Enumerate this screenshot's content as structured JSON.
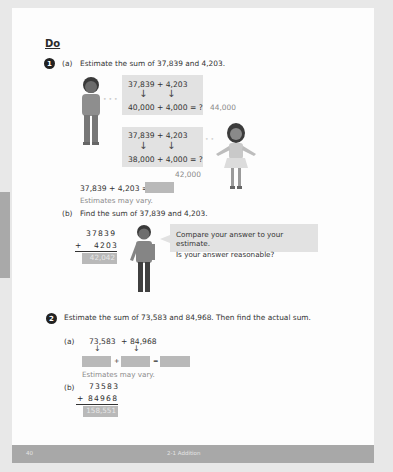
{
  "section": {
    "heading": "Do"
  },
  "problem1": {
    "number": "1",
    "part_a": {
      "label": "(a)",
      "prompt": "Estimate the sum of 37,839 and 4,203.",
      "boy_box": {
        "top": "37,839 + 4,203",
        "bottom": "40,000 + 4,000 = ?",
        "answer": "44,000"
      },
      "girl_box": {
        "top": "37,839 + 4,203",
        "bottom": "38,000 + 4,000 = ?",
        "answer": "42,000"
      },
      "equation": "37,839 + 4,203 =",
      "note": "Estimates may vary."
    },
    "part_b": {
      "label": "(b)",
      "prompt": "Find the sum of 37,839 and 4,203.",
      "addend1": "37839",
      "operator": "+",
      "addend2": "4203",
      "answer": "42,042",
      "bubble_line1": "Compare your answer to your estimate.",
      "bubble_line2": "Is your answer reasonable?"
    }
  },
  "problem2": {
    "number": "2",
    "prompt": "Estimate the sum of 73,583 and 84,968. Then find the actual sum.",
    "part_a": {
      "label": "(a)",
      "expression_left": "73,583",
      "plus": "+",
      "expression_right": "84,968",
      "equals": "=",
      "note": "Estimates may vary."
    },
    "part_b": {
      "label": "(b)",
      "addend1": "73583",
      "operator": "+",
      "addend2": "84968",
      "answer": "158,551"
    }
  },
  "footer": {
    "page_number": "40",
    "chapter": "2-1  Addition"
  },
  "icons": {
    "arrow_down": "↓"
  }
}
